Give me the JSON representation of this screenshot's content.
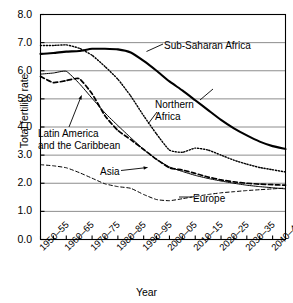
{
  "chart_data": {
    "type": "line",
    "title": "",
    "xlabel": "Year",
    "ylabel": "Total fertility rate",
    "ylim": [
      0.0,
      8.0
    ],
    "ytick_labels": [
      "0.0",
      "1.0",
      "2.0",
      "3.0",
      "4.0",
      "5.0",
      "6.0",
      "7.0",
      "8.0"
    ],
    "ytick_values": [
      0.0,
      1.0,
      2.0,
      3.0,
      4.0,
      5.0,
      6.0,
      7.0,
      8.0
    ],
    "grid": "horizontal",
    "legend_position": "inline-annotations",
    "categories": [
      "1950-55",
      "1955-60",
      "1960-65",
      "1965-70",
      "1970-75",
      "1975-80",
      "1980-85",
      "1985-90",
      "1990-95",
      "1995-00",
      "2000-05",
      "2005-10",
      "2010-15",
      "2015-20",
      "2020-25",
      "2025-30",
      "2030-35",
      "2035-40",
      "2040-45",
      "2045-50"
    ],
    "xtick_labels": [
      "1950–55",
      "1960–65",
      "1970–75",
      "1980–85",
      "1990–95",
      "2000–05",
      "2010–15",
      "2020–25",
      "2030–35",
      "2040–45"
    ],
    "series": [
      {
        "name": "Sub-Saharan Africa",
        "style": "solid-thick",
        "color": "#000000",
        "values": [
          6.6,
          6.63,
          6.68,
          6.7,
          6.78,
          6.78,
          6.76,
          6.65,
          6.35,
          6.0,
          5.62,
          5.3,
          4.95,
          4.6,
          4.25,
          3.95,
          3.7,
          3.48,
          3.32,
          3.22
        ]
      },
      {
        "name": "Northern Africa",
        "style": "dotted",
        "color": "#000000",
        "values": [
          6.9,
          6.9,
          6.92,
          6.8,
          6.55,
          6.15,
          5.7,
          5.1,
          4.4,
          3.75,
          3.18,
          3.1,
          3.25,
          3.18,
          3.0,
          2.82,
          2.68,
          2.56,
          2.48,
          2.4
        ]
      },
      {
        "name": "Latin America and the Caribbean",
        "style": "solid-thin",
        "color": "#000000",
        "values": [
          5.88,
          5.92,
          5.98,
          5.55,
          5.02,
          4.5,
          4.05,
          3.62,
          3.2,
          2.85,
          2.58,
          2.42,
          2.28,
          2.17,
          2.08,
          2.0,
          1.93,
          1.88,
          1.84,
          1.8
        ]
      },
      {
        "name": "Asia",
        "style": "dashed-thick",
        "color": "#000000",
        "values": [
          5.8,
          5.58,
          5.65,
          5.72,
          5.18,
          4.4,
          3.88,
          3.55,
          3.2,
          2.85,
          2.55,
          2.47,
          2.35,
          2.22,
          2.12,
          2.05,
          2.0,
          1.97,
          1.95,
          1.93
        ]
      },
      {
        "name": "Europe",
        "style": "dashed-thin",
        "color": "#000000",
        "values": [
          2.66,
          2.62,
          2.55,
          2.38,
          2.18,
          1.98,
          1.88,
          1.82,
          1.6,
          1.42,
          1.38,
          1.45,
          1.53,
          1.6,
          1.66,
          1.7,
          1.74,
          1.77,
          1.8,
          1.83
        ]
      }
    ],
    "annotations": [
      {
        "name": "sub-saharan-africa",
        "text": "Sub-Saharan Africa"
      },
      {
        "name": "northern-africa",
        "text_line1": "Northern",
        "text_line2": "Africa"
      },
      {
        "name": "latin-america",
        "text_line1": "Latin America",
        "text_line2": "and the Caribbean"
      },
      {
        "name": "asia",
        "text": "Asia"
      },
      {
        "name": "europe",
        "text": "Europe"
      }
    ]
  },
  "axes": {
    "y_title": "Total fertility rate",
    "x_title": "Year",
    "y_ticks": [
      "8.0",
      "7.0",
      "6.0",
      "5.0",
      "4.0",
      "3.0",
      "2.0",
      "1.0",
      "0.0"
    ],
    "x_ticks": [
      "1950–55",
      "1960–65",
      "1970–75",
      "1980–85",
      "1990–95",
      "2000–05",
      "2010–15",
      "2020–25",
      "2030–35",
      "2040–45"
    ]
  },
  "labels": {
    "sub_saharan_africa": "Sub-Saharan Africa",
    "northern_africa_l1": "Northern",
    "northern_africa_l2": "Africa",
    "latin_america_l1": "Latin America",
    "latin_america_l2": "and the Caribbean",
    "asia": "Asia",
    "europe": "Europe"
  },
  "colors": {
    "line": "#000000",
    "grid": "#808080",
    "axis": "#000000",
    "background": "#ffffff"
  }
}
